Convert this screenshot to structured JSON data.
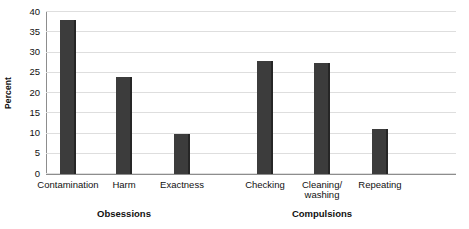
{
  "chart_data": {
    "type": "bar",
    "title": "",
    "xlabel": "",
    "ylabel": "Percent",
    "ylim": [
      0,
      40
    ],
    "yticks": [
      0,
      5,
      10,
      15,
      20,
      25,
      30,
      35,
      40
    ],
    "grid": true,
    "legend": "none",
    "bar_color": "#3c3c3c",
    "categories": [
      "Contamination",
      "Harm",
      "Exactness",
      "Checking",
      "Cleaning/\nwashing",
      "Repeating"
    ],
    "values": [
      38,
      24,
      10,
      28,
      27.5,
      11
    ],
    "groups": [
      {
        "label": "Obsessions",
        "categories": [
          "Contamination",
          "Harm",
          "Exactness"
        ]
      },
      {
        "label": "Compulsions",
        "categories": [
          "Cleaning/\nwashing",
          "Checking",
          "Repeating"
        ]
      }
    ],
    "group_labels": [
      "Obsessions",
      "Compulsions"
    ]
  }
}
